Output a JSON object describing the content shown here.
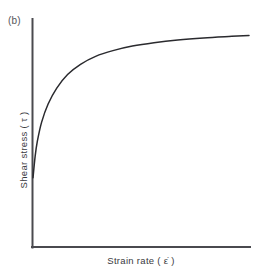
{
  "figure": {
    "panel_label": "(b)",
    "background_color": "#ffffff",
    "axis_color": "#4a4a4f",
    "curve_color": "#2a2a2e",
    "text_color": "#3a3a3e"
  },
  "axes": {
    "y_label": "Shear stress  ( τ )",
    "x_label": "Strain rate   ( ε̇ )",
    "y_axis_title": "Shear stress",
    "y_axis_symbol": "τ",
    "x_axis_title": "Strain rate",
    "x_axis_symbol": "ε̇"
  },
  "chart_data": {
    "type": "line",
    "title": "(b)",
    "xlabel": "Strain rate ( ε̇ )",
    "ylabel": "Shear stress ( τ )",
    "xlim": [
      0,
      100
    ],
    "ylim": [
      0,
      100
    ],
    "grid": false,
    "legend": "none",
    "ticks": {
      "x": [],
      "y": []
    },
    "annotations": [
      "(b)"
    ],
    "series": [
      {
        "name": "shear-thinning flow curve",
        "x": [
          0,
          1,
          2,
          4,
          7,
          11,
          16,
          22,
          29,
          37,
          46,
          56,
          67,
          79,
          92,
          100
        ],
        "y": [
          30.5,
          40,
          46.5,
          55,
          63,
          70,
          76,
          80.5,
          84,
          86.5,
          88.5,
          90,
          91.2,
          92.1,
          92.8,
          93.2
        ]
      }
    ]
  }
}
